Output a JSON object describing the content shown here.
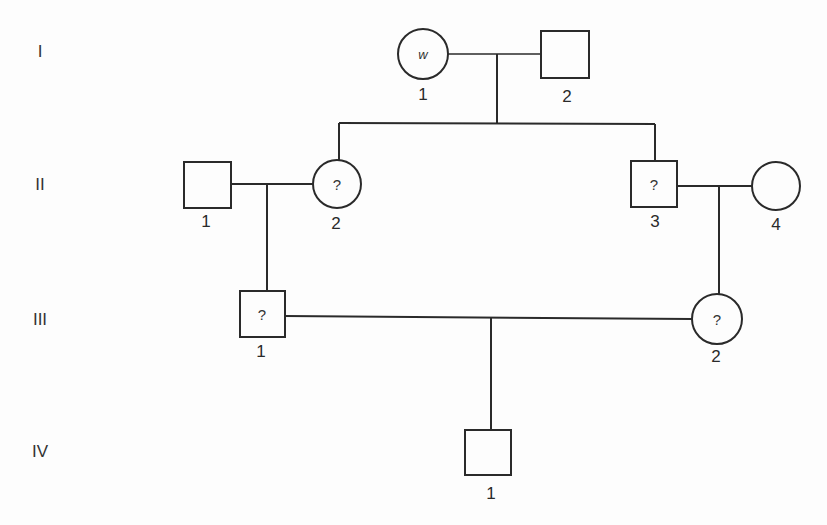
{
  "generations": [
    "I",
    "II",
    "III",
    "IV"
  ],
  "individuals": {
    "I_1": {
      "number": "1",
      "sex": "female",
      "mark": "w"
    },
    "I_2": {
      "number": "2",
      "sex": "male",
      "mark": ""
    },
    "II_1": {
      "number": "1",
      "sex": "male",
      "mark": ""
    },
    "II_2": {
      "number": "2",
      "sex": "female",
      "mark": "?"
    },
    "II_3": {
      "number": "3",
      "sex": "male",
      "mark": "?"
    },
    "II_4": {
      "number": "4",
      "sex": "female",
      "mark": ""
    },
    "III_1": {
      "number": "1",
      "sex": "male",
      "mark": "?"
    },
    "III_2": {
      "number": "2",
      "sex": "female",
      "mark": "?"
    },
    "IV_1": {
      "number": "1",
      "sex": "male",
      "mark": ""
    }
  },
  "colors": {
    "line": "#2a2a2a",
    "background": "#fdfdfd"
  }
}
